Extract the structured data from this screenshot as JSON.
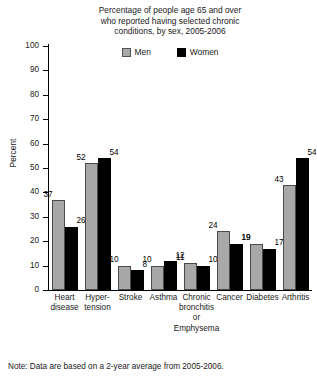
{
  "chart_data": {
    "type": "bar",
    "title": "Percentage of people age 65 and over who reported having selected chronic conditions, by sex, 2005-2006",
    "title_lines": [
      "Percentage of people age 65 and over",
      "who reported having selected chronic",
      "conditions, by sex, 2005-2006"
    ],
    "xlabel": "",
    "ylabel": "Percent",
    "ylim": [
      0,
      100
    ],
    "ytick_step": 10,
    "yticks": [
      100,
      90,
      80,
      70,
      60,
      50,
      40,
      30,
      20,
      10,
      0
    ],
    "grid": false,
    "legend_position": "top-center",
    "categories": [
      "Heart disease",
      "Hypertension",
      "Stroke",
      "Asthma",
      "Chronic bronchitis or Emphysema",
      "Cancer",
      "Diabetes",
      "Arthritis"
    ],
    "category_label_lines": [
      [
        "Heart",
        "disease"
      ],
      [
        "Hyper-",
        "tension"
      ],
      [
        "Stroke"
      ],
      [
        "Asthma"
      ],
      [
        "Chronic",
        "bronchitis",
        "or",
        "Emphysema"
      ],
      [
        "Cancer"
      ],
      [
        "Diabetes"
      ],
      [
        "Arthritis"
      ]
    ],
    "series": [
      {
        "name": "Men",
        "color": "#a8a8a8",
        "values": [
          37,
          52,
          10,
          10,
          11,
          24,
          19,
          43
        ]
      },
      {
        "name": "Women",
        "color": "#000000",
        "values": [
          26,
          54,
          8,
          12,
          10,
          19,
          17,
          54
        ]
      }
    ],
    "annotations": [
      "Note: Data are based on a 2-year average from 2005-2006."
    ]
  },
  "footnote": {
    "text": "Note: Data are based on a 2-year average from 2005-2006."
  }
}
